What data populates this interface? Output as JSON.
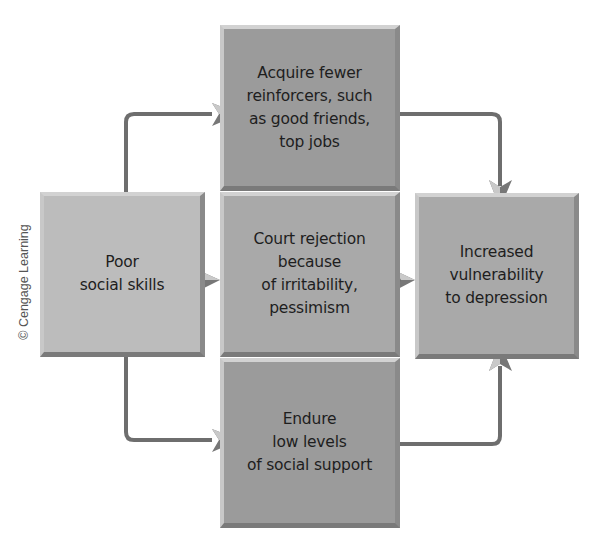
{
  "diagram": {
    "copyright": "© Cengage Learning",
    "nodes": {
      "cause": {
        "label": "Poor\nsocial skills"
      },
      "top": {
        "label": "Acquire fewer\nreinforcers, such\nas good  friends,\ntop jobs"
      },
      "middle": {
        "label": "Court  rejection\nbecause\nof  irritability,\npessimism"
      },
      "bottom": {
        "label": "Endure\nlow levels\nof social support"
      },
      "outcome": {
        "label": "Increased\nvulnerability\nto depression"
      }
    },
    "edges": [
      {
        "from": "cause",
        "to": "top"
      },
      {
        "from": "cause",
        "to": "middle"
      },
      {
        "from": "cause",
        "to": "bottom"
      },
      {
        "from": "top",
        "to": "outcome"
      },
      {
        "from": "middle",
        "to": "outcome"
      },
      {
        "from": "bottom",
        "to": "outcome"
      }
    ],
    "colors": {
      "box_dark": "#9b9b9b",
      "box_mid": "#a9a9a9",
      "box_light": "#bcbcbc",
      "arrow": "#707070"
    }
  }
}
